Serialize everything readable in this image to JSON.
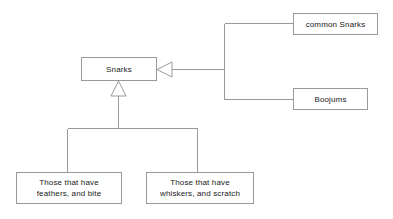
{
  "diagram": {
    "type": "uml-generalization-diagram",
    "background_color": "#ffffff",
    "line_color": "#9a9a9a",
    "text_color": "#1a1a1a",
    "nodes": [
      {
        "id": "snarks",
        "label": "Snarks",
        "x": 81,
        "y": 57,
        "w": 76,
        "h": 24
      },
      {
        "id": "common_snarks",
        "label": "common Snarks",
        "x": 293,
        "y": 13,
        "w": 85,
        "h": 22
      },
      {
        "id": "boojums",
        "label": "Boojums",
        "x": 293,
        "y": 88,
        "w": 75,
        "h": 22
      },
      {
        "id": "feathers",
        "label": "Those that have\nfeathers,  and bite",
        "x": 16,
        "y": 172,
        "w": 106,
        "h": 32
      },
      {
        "id": "whiskers",
        "label": "Those  that have\nwhiskers,   and scratch",
        "x": 146,
        "y": 172,
        "w": 108,
        "h": 32
      }
    ],
    "edges": [
      {
        "id": "edge-right-group",
        "from": [
          "common_snarks",
          "boojums"
        ],
        "to": "snarks",
        "arrow": "hollow-triangle-left"
      },
      {
        "id": "edge-bottom-group",
        "from": [
          "feathers",
          "whiskers"
        ],
        "to": "snarks",
        "arrow": "hollow-triangle-up"
      }
    ]
  }
}
